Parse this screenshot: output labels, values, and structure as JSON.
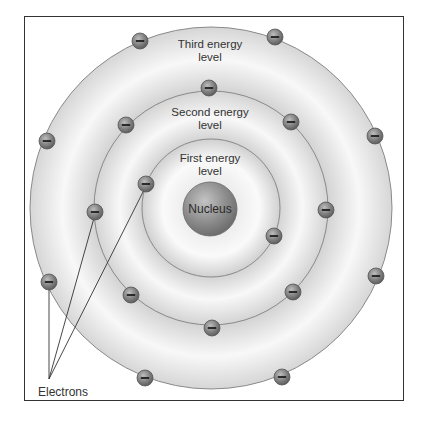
{
  "diagram": {
    "title": "",
    "colors": {
      "ring_fill": "#d9d9d9",
      "ring_highlight": "#f7f7f7",
      "ring_edge": "#8a8a8a",
      "nucleus": "#8c8c8c",
      "electron": "#7d7d7d",
      "text": "#333333",
      "frame": "#333333"
    },
    "nucleus": {
      "label": "Nucleus"
    },
    "levels": [
      {
        "label_line1": "First energy",
        "label_line2": "level"
      },
      {
        "label_line1": "Second energy",
        "label_line2": "level"
      },
      {
        "label_line1": "Third energy",
        "label_line2": "level"
      }
    ],
    "electron_symbol": "−",
    "electrons_label": "Electrons",
    "electron_counts": {
      "first": 2,
      "second": 8,
      "third": 8
    }
  }
}
